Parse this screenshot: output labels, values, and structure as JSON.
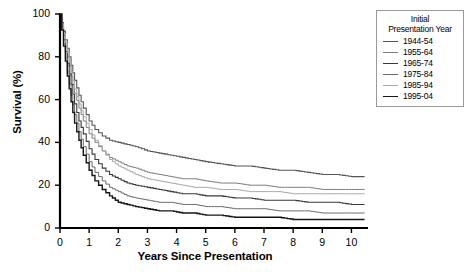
{
  "chart_data": {
    "type": "line",
    "title": "",
    "xlabel": "Years Since Presentation",
    "ylabel": "Survival (%)",
    "xlim": [
      0,
      10.5
    ],
    "ylim": [
      0,
      100
    ],
    "xticks": [
      "0",
      "1",
      "2",
      "3",
      "4",
      "5",
      "6",
      "7",
      "8",
      "9",
      "10"
    ],
    "yticks": [
      "0",
      "20",
      "40",
      "60",
      "80",
      "100"
    ],
    "grid": false,
    "legend_position": "top-right",
    "legend_title_line1": "Initial",
    "legend_title_line2": "Presentation Year",
    "series": [
      {
        "name": "1944-54",
        "color": "#555555",
        "width": 1.1,
        "x": [
          0,
          0.12,
          0.25,
          0.38,
          0.5,
          0.65,
          0.8,
          1.0,
          1.2,
          1.45,
          1.7,
          2.0,
          2.3,
          2.6,
          3.0,
          3.4,
          3.8,
          4.2,
          4.6,
          5.0,
          5.5,
          6.0,
          6.5,
          7.0,
          7.5,
          8.0,
          8.5,
          9.0,
          9.5,
          10.0,
          10.45
        ],
        "y": [
          100,
          92,
          84,
          76,
          69,
          62,
          56,
          50,
          46,
          43,
          41,
          40,
          39,
          38,
          36,
          35,
          34,
          33,
          32,
          31,
          30,
          29,
          29,
          28,
          27,
          27,
          26,
          25,
          25,
          24,
          24
        ]
      },
      {
        "name": "1955-64",
        "color": "#7d7d7d",
        "width": 1.0,
        "x": [
          0,
          0.12,
          0.25,
          0.38,
          0.5,
          0.65,
          0.8,
          1.0,
          1.2,
          1.45,
          1.7,
          2.0,
          2.3,
          2.6,
          3.0,
          3.4,
          3.8,
          4.2,
          4.6,
          5.0,
          5.5,
          6.0,
          6.5,
          7.0,
          7.5,
          8.0,
          8.5,
          9.0,
          9.5,
          10.0,
          10.45
        ],
        "y": [
          100,
          90,
          80,
          71,
          63,
          56,
          50,
          44,
          40,
          36,
          33,
          31,
          29,
          28,
          26,
          25,
          24,
          23,
          23,
          22,
          21,
          21,
          20,
          20,
          19,
          19,
          19,
          18,
          18,
          18,
          18
        ]
      },
      {
        "name": "1965-74",
        "color": "#3a3a3a",
        "width": 1.1,
        "x": [
          0,
          0.12,
          0.25,
          0.38,
          0.5,
          0.65,
          0.8,
          1.0,
          1.2,
          1.45,
          1.7,
          2.0,
          2.3,
          2.6,
          3.0,
          3.4,
          3.8,
          4.2,
          4.6,
          5.0,
          5.5,
          6.0,
          6.5,
          7.0,
          7.5,
          8.0,
          8.5,
          9.0,
          9.5,
          10.0,
          10.45
        ],
        "y": [
          100,
          88,
          77,
          67,
          58,
          50,
          44,
          37,
          32,
          28,
          25,
          23,
          21,
          20,
          19,
          18,
          17,
          16,
          16,
          15,
          15,
          14,
          14,
          13,
          13,
          13,
          12,
          12,
          12,
          11,
          11
        ]
      },
      {
        "name": "1975-84",
        "color": "#6b6b6b",
        "width": 1.0,
        "x": [
          0,
          0.12,
          0.25,
          0.38,
          0.5,
          0.65,
          0.8,
          1.0,
          1.2,
          1.45,
          1.7,
          2.0,
          2.3,
          2.6,
          3.0,
          3.4,
          3.8,
          4.2,
          4.6,
          5.0,
          5.5,
          6.0,
          6.5,
          7.0,
          7.5,
          8.0,
          8.5,
          9.0,
          9.5,
          10.0,
          10.45
        ],
        "y": [
          100,
          86,
          73,
          62,
          53,
          45,
          38,
          31,
          26,
          22,
          19,
          17,
          15,
          14,
          13,
          12,
          12,
          11,
          11,
          10,
          10,
          9,
          9,
          9,
          8,
          8,
          8,
          7,
          7,
          7,
          7
        ]
      },
      {
        "name": "1985-94",
        "color": "#a8a8a8",
        "width": 1.0,
        "x": [
          0,
          0.12,
          0.25,
          0.38,
          0.5,
          0.65,
          0.8,
          1.0,
          1.2,
          1.45,
          1.7,
          2.0,
          2.3,
          2.6,
          3.0,
          3.4,
          3.8,
          4.2,
          4.6,
          5.0,
          5.5,
          6.0,
          6.5,
          7.0,
          7.5,
          8.0,
          8.5,
          9.0,
          9.5,
          10.0,
          10.45
        ],
        "y": [
          100,
          91,
          82,
          73,
          65,
          58,
          52,
          46,
          41,
          36,
          32,
          29,
          27,
          25,
          23,
          22,
          21,
          20,
          19,
          19,
          18,
          18,
          17,
          17,
          17,
          16,
          16,
          16,
          16,
          16,
          16
        ]
      },
      {
        "name": "1995-04",
        "color": "#161616",
        "width": 1.4,
        "x": [
          0,
          0.12,
          0.25,
          0.38,
          0.5,
          0.65,
          0.8,
          1.0,
          1.2,
          1.45,
          1.7,
          2.0,
          2.3,
          2.6,
          3.0,
          3.4,
          3.8,
          4.2,
          4.6,
          5.0,
          5.5,
          6.0,
          6.5,
          7.0,
          7.5,
          8.0,
          8.5,
          9.0,
          9.5,
          10.0,
          10.45
        ],
        "y": [
          100,
          85,
          71,
          59,
          49,
          41,
          34,
          27,
          22,
          18,
          15,
          12,
          11,
          10,
          9,
          8,
          8,
          7,
          7,
          6,
          6,
          5,
          5,
          5,
          5,
          4,
          4,
          4,
          4,
          4,
          4
        ]
      }
    ]
  },
  "axes": {
    "y_title": "Survival (%)",
    "x_title": "Years Since Presentation"
  }
}
